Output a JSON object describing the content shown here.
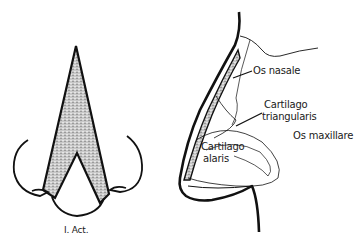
{
  "figure": {
    "front_view": {
      "caption": "I. Act."
    },
    "side_view": {
      "labels": {
        "os_nasale": "Os nasale",
        "cartilago_triangularis_line1": "Cartilago",
        "cartilago_triangularis_line2": "triangularis",
        "os_maxillare": "Os maxillare",
        "cartilago_alaris_line1": "Cartilago",
        "cartilago_alaris_line2": "alaris"
      }
    },
    "colors": {
      "ink": "#111111",
      "shading": "#b5b5b5",
      "background": "#ffffff"
    }
  }
}
